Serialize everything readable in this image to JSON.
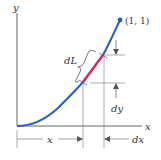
{
  "diagram": {
    "type": "arc-length-element",
    "colors": {
      "curve": "#2a5dc8",
      "segment": "#e0245a",
      "axis": "#444444",
      "dimension": "#666666",
      "text": "#333333"
    },
    "labels": {
      "y_axis": "y",
      "x_axis": "x",
      "endpoint": "(1, 1)",
      "arc_element": "dL",
      "vertical_increment": "dy",
      "horizontal_position": "x",
      "horizontal_increment": "dx"
    }
  }
}
